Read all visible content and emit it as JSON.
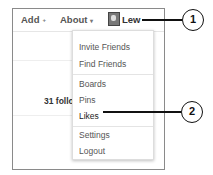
{
  "navbar": {
    "add_label": "Add",
    "add_caret": "+",
    "about_label": "About",
    "about_caret": "▾",
    "user_name": "Lew"
  },
  "profile": {
    "followers_text": "31 followers"
  },
  "user_menu": {
    "items": [
      {
        "label": "Invite Friends"
      },
      {
        "label": "Find Friends"
      },
      {
        "label": "Boards"
      },
      {
        "label": "Pins"
      },
      {
        "label": "Likes"
      },
      {
        "label": "Settings"
      },
      {
        "label": "Logout"
      }
    ]
  },
  "callouts": [
    {
      "number": "1",
      "target": "Lew"
    },
    {
      "number": "2",
      "target": "Likes"
    }
  ]
}
